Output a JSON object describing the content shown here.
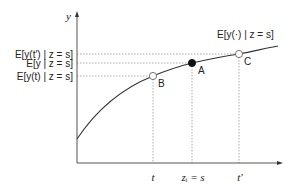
{
  "diagram": {
    "axes": {
      "y_label": "y",
      "x_ticks": [
        {
          "id": "t",
          "label": "t",
          "x": 153
        },
        {
          "id": "zi",
          "label": "zᵢ = s",
          "x": 192
        },
        {
          "id": "tprime",
          "label": "t′",
          "x": 239
        }
      ],
      "y_ticks": [
        {
          "id": "tprime",
          "label": "E[y(t′) | z = s]",
          "y": 54
        },
        {
          "id": "y",
          "label": "E[y | z = s]",
          "y": 63
        },
        {
          "id": "t",
          "label": "E[y(t) | z = s]",
          "y": 76
        }
      ]
    },
    "curve_label": "E[y(·) | z = s]",
    "points": [
      {
        "id": "A",
        "label": "A",
        "filled": true,
        "x": 192,
        "y": 63
      },
      {
        "id": "B",
        "label": "B",
        "filled": false,
        "x": 153,
        "y": 76
      },
      {
        "id": "C",
        "label": "C",
        "filled": false,
        "x": 239,
        "y": 54
      }
    ],
    "colors": {
      "line": "#333333",
      "dashed": "#999999",
      "text": "#222222"
    }
  }
}
